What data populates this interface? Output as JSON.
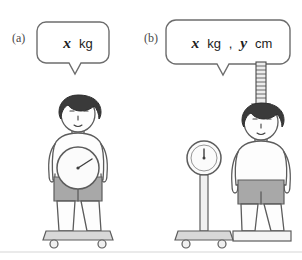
{
  "figure": {
    "background_color": "#ffffff",
    "outline_color": "#5c5c5c",
    "shorts_color": "#a8a8a8",
    "hair_color": "#3a3a3a"
  },
  "panels": [
    {
      "id": "a",
      "label": "(a)",
      "bubble": {
        "variable_1": "x",
        "unit_1": "kg",
        "separator": "",
        "variable_2": "",
        "unit_2": ""
      },
      "scene_description": "person-standing-on-wheeled-weighing-platform-with-dial-on-torso",
      "instruments": [
        "weight-dial",
        "wheeled-platform"
      ]
    },
    {
      "id": "b",
      "label": "(b)",
      "bubble": {
        "variable_1": "x",
        "unit_1": "kg",
        "separator": ",",
        "variable_2": "y",
        "unit_2": "cm"
      },
      "scene_description": "standing-dial-scale-beside-person-on-platform-under-height-rod",
      "instruments": [
        "dial-scale-on-post",
        "height-measuring-rod",
        "flat-platform"
      ]
    }
  ]
}
